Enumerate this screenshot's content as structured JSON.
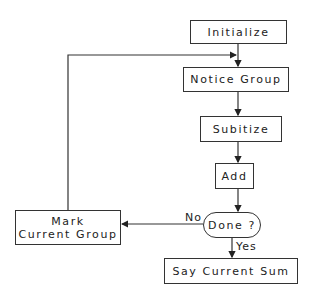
{
  "diagram": {
    "type": "flowchart",
    "nodes": {
      "initialize": "Initialize",
      "notice_group": "Notice Group",
      "subitize": "Subitize",
      "add": "Add",
      "done": "Done ?",
      "mark_line1": "Mark",
      "mark_line2": "Current Group",
      "say_sum": "Say Current Sum"
    },
    "edge_labels": {
      "no": "No",
      "yes": "Yes"
    },
    "edges": [
      {
        "from": "Initialize",
        "to": "Notice Group"
      },
      {
        "from": "Notice Group",
        "to": "Subitize"
      },
      {
        "from": "Subitize",
        "to": "Add"
      },
      {
        "from": "Add",
        "to": "Done ?"
      },
      {
        "from": "Done ?",
        "to": "Mark Current Group",
        "label": "No"
      },
      {
        "from": "Done ?",
        "to": "Say Current Sum",
        "label": "Yes"
      },
      {
        "from": "Mark Current Group",
        "to": "Notice Group"
      }
    ]
  }
}
